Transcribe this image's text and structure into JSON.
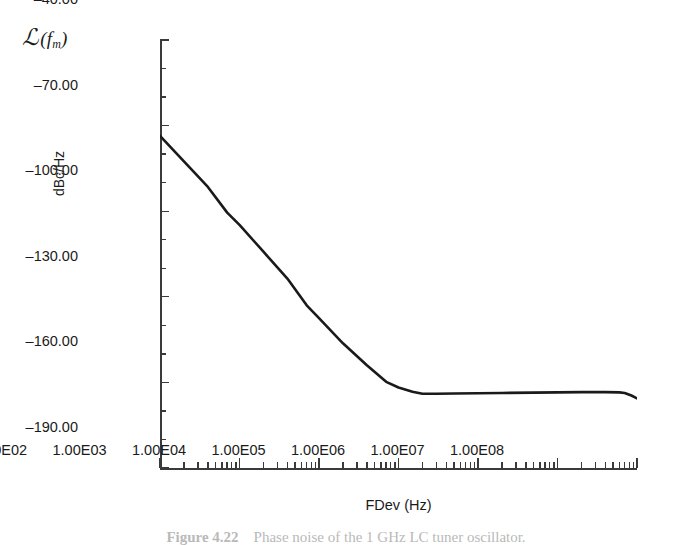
{
  "figure": {
    "corner_symbol": {
      "script_l": "ℒ",
      "open_paren": "(",
      "f": "f",
      "subscript": "m",
      "close_paren": ")"
    },
    "caption": {
      "label": "Figure 4.22",
      "text": "Phase noise of the 1 GHz LC tuner oscillator."
    }
  },
  "chart_data": {
    "type": "line",
    "title": "",
    "xlabel": "FDev (Hz)",
    "ylabel": "dBc/Hz",
    "xscale": "log",
    "xlim": [
      100,
      100000000
    ],
    "ylim": [
      -190,
      -40
    ],
    "ytick_step": 30,
    "yminor_step": 10,
    "grid": false,
    "legend": null,
    "xtick_labels": [
      "1.00E02",
      "1.00E03",
      "1.00E04",
      "1.00E05",
      "1.00E06",
      "1.00E07",
      "1.00E08"
    ],
    "xtick_values": [
      100,
      1000,
      10000,
      100000,
      1000000,
      10000000,
      100000000
    ],
    "ytick_labels": [
      "-40.00",
      "-70.00",
      "-100.00",
      "-130.00",
      "-160.00",
      "-190.00"
    ],
    "ytick_values": [
      -40,
      -70,
      -100,
      -130,
      -160,
      -190
    ],
    "series": [
      {
        "name": "phase noise",
        "color": "#1a1a1a",
        "linewidth": 2.6,
        "x": [
          100,
          200,
          400,
          700,
          1000,
          2000,
          4000,
          7000,
          10000,
          20000,
          40000,
          70000,
          100000,
          150000,
          200000,
          300000,
          500000,
          1000000,
          2000000,
          5000000,
          10000000,
          20000000,
          40000000,
          60000000,
          70000000,
          85000000,
          100000000
        ],
        "y": [
          -73.6,
          -82.5,
          -91.5,
          -100.5,
          -104.8,
          -114.2,
          -123.6,
          -133.0,
          -137.5,
          -146.3,
          -154.0,
          -159.8,
          -161.8,
          -163.3,
          -164.0,
          -164.0,
          -163.9,
          -163.8,
          -163.7,
          -163.6,
          -163.5,
          -163.4,
          -163.4,
          -163.5,
          -163.7,
          -164.6,
          -165.6
        ]
      }
    ],
    "annotations": [
      {
        "text": "slope approx -30 dB/decade in 1/f region"
      },
      {
        "text": "noise floor knee near 2.0E05 Hz at -164 dBc/Hz"
      }
    ]
  }
}
